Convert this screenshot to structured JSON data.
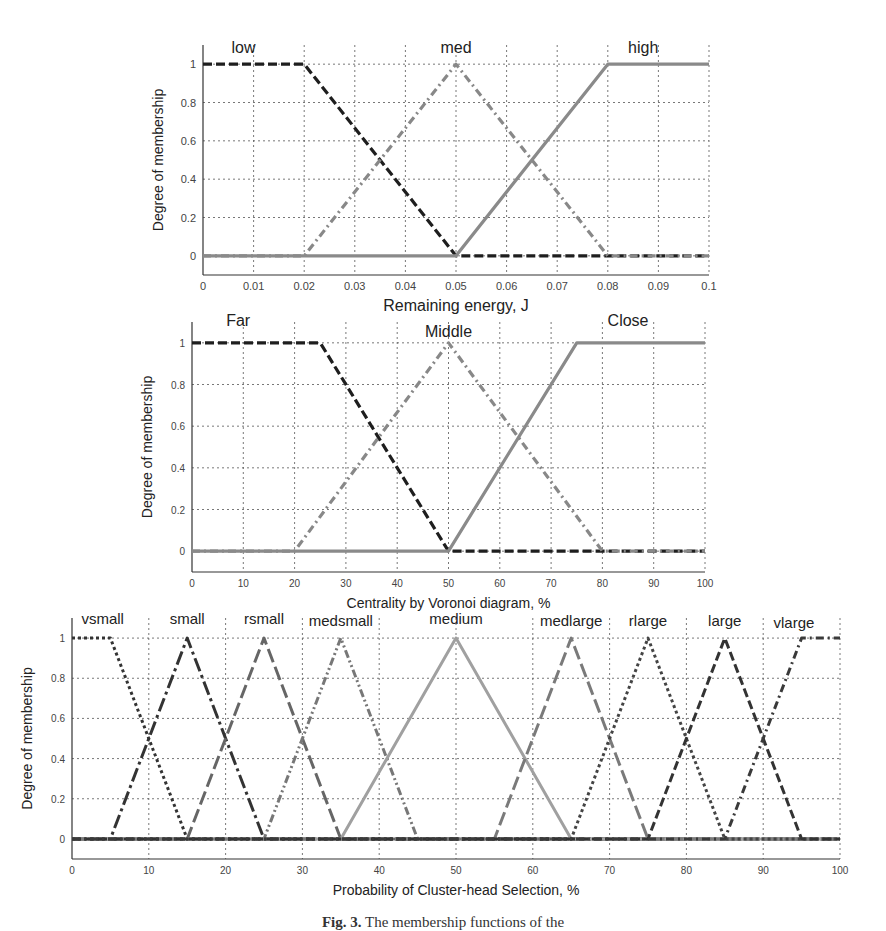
{
  "figure": {
    "caption_label": "Fig. 3.",
    "caption_text": "The membership functions of the"
  },
  "chart_data": [
    {
      "type": "line",
      "title": "",
      "xlabel": "Remaining energy, J",
      "ylabel": "Degree of membership",
      "xlim": [
        0,
        0.1
      ],
      "ylim": [
        -0.1,
        1.1
      ],
      "grid": true,
      "xticks": [
        0,
        0.01,
        0.02,
        0.03,
        0.04,
        0.05,
        0.06,
        0.07,
        0.08,
        0.09,
        0.1
      ],
      "xtick_labels": [
        "0",
        "0.01",
        "0.02",
        "0.03",
        "0.04",
        "0.05",
        "0.06",
        "0.07",
        "0.08",
        "0.09",
        "0.1"
      ],
      "yticks": [
        0,
        0.2,
        0.4,
        0.6,
        0.8,
        1
      ],
      "ytick_labels": [
        "0",
        "0.2",
        "0.4",
        "0.6",
        "0.8",
        "1"
      ],
      "box": {
        "left": 203,
        "right": 709,
        "top": 45,
        "bottom": 275
      },
      "series": [
        {
          "name": "low",
          "label_x": 0.008,
          "label_y": 1.06,
          "style": "dashed",
          "color": "#1e1e1e",
          "x": [
            0,
            0.02,
            0.05,
            0.1
          ],
          "y": [
            1,
            1,
            0,
            0
          ]
        },
        {
          "name": "med",
          "label_x": 0.05,
          "label_y": 1.06,
          "style": "dashdot",
          "color": "#888888",
          "x": [
            0,
            0.02,
            0.05,
            0.08,
            0.1
          ],
          "y": [
            0,
            0,
            1,
            0,
            0
          ]
        },
        {
          "name": "high",
          "label_x": 0.087,
          "label_y": 1.06,
          "style": "solid",
          "color": "#8a8a8a",
          "x": [
            0,
            0.05,
            0.08,
            0.1
          ],
          "y": [
            0,
            0,
            1,
            1
          ]
        }
      ]
    },
    {
      "type": "line",
      "title": "",
      "xlabel": "Centrality by Voronoi diagram, %",
      "ylabel": "Degree of membership",
      "xlim": [
        0,
        100
      ],
      "ylim": [
        -0.1,
        1.1
      ],
      "grid": true,
      "xticks": [
        0,
        10,
        20,
        30,
        40,
        50,
        60,
        70,
        80,
        90,
        100
      ],
      "xtick_labels": [
        "0",
        "10",
        "20",
        "30",
        "40",
        "50",
        "60",
        "70",
        "80",
        "90",
        "100"
      ],
      "yticks": [
        0,
        0.2,
        0.4,
        0.6,
        0.8,
        1
      ],
      "ytick_labels": [
        "0",
        "0.2",
        "0.4",
        "0.6",
        "0.8",
        "1"
      ],
      "box": {
        "left": 192,
        "right": 705,
        "top": 322,
        "bottom": 572
      },
      "series": [
        {
          "name": "Far",
          "label_x": 9,
          "label_y": 1.08,
          "style": "dashed",
          "color": "#1e1e1e",
          "x": [
            0,
            25,
            50,
            100
          ],
          "y": [
            1,
            1,
            0,
            0
          ]
        },
        {
          "name": "Middle",
          "label_x": 50,
          "label_y": 1.03,
          "style": "dashdot",
          "color": "#888888",
          "x": [
            0,
            20,
            50,
            80,
            100
          ],
          "y": [
            0,
            0,
            1,
            0,
            0
          ]
        },
        {
          "name": "Close",
          "label_x": 85,
          "label_y": 1.08,
          "style": "solid",
          "color": "#8a8a8a",
          "x": [
            0,
            50,
            75,
            100
          ],
          "y": [
            0,
            0,
            1,
            1
          ]
        }
      ]
    },
    {
      "type": "line",
      "title": "",
      "xlabel": "Probability of Cluster-head Selection, %",
      "ylabel": "Degree of membership",
      "xlim": [
        0,
        100
      ],
      "ylim": [
        -0.1,
        1.1
      ],
      "grid": true,
      "xticks": [
        0,
        10,
        20,
        30,
        40,
        50,
        60,
        70,
        80,
        90,
        100
      ],
      "xtick_labels": [
        "0",
        "10",
        "20",
        "30",
        "40",
        "50",
        "60",
        "70",
        "80",
        "90",
        "100"
      ],
      "yticks": [
        0,
        0.2,
        0.4,
        0.6,
        0.8,
        1
      ],
      "ytick_labels": [
        "0",
        "0.2",
        "0.4",
        "0.6",
        "0.8",
        "1"
      ],
      "box": {
        "left": 72,
        "right": 840,
        "top": 618,
        "bottom": 859
      },
      "series": [
        {
          "name": "vsmall",
          "label_x": 4,
          "label_y": 1.07,
          "style": "dotted",
          "color": "#333333",
          "x": [
            0,
            5,
            15,
            100
          ],
          "y": [
            1,
            1,
            0,
            0
          ]
        },
        {
          "name": "small",
          "label_x": 15,
          "label_y": 1.07,
          "style": "longdashdot",
          "color": "#333333",
          "x": [
            0,
            5,
            15,
            25,
            100
          ],
          "y": [
            0,
            0,
            1,
            0,
            0
          ]
        },
        {
          "name": "rsmall",
          "label_x": 25,
          "label_y": 1.07,
          "style": "longdash",
          "color": "#666666",
          "x": [
            0,
            15,
            25,
            35,
            100
          ],
          "y": [
            0,
            0,
            1,
            0,
            0
          ]
        },
        {
          "name": "medsmall",
          "label_x": 35,
          "label_y": 1.06,
          "style": "dashdotdot",
          "color": "#777777",
          "x": [
            0,
            25,
            35,
            45,
            100
          ],
          "y": [
            0,
            0,
            1,
            0,
            0
          ]
        },
        {
          "name": "medium",
          "label_x": 50,
          "label_y": 1.07,
          "style": "solid",
          "color": "#a0a0a0",
          "x": [
            0,
            35,
            50,
            65,
            100
          ],
          "y": [
            0,
            0,
            1,
            0,
            0
          ]
        },
        {
          "name": "medlarge",
          "label_x": 65,
          "label_y": 1.06,
          "style": "longdash",
          "color": "#7a7a7a",
          "x": [
            0,
            55,
            65,
            75,
            100
          ],
          "y": [
            0,
            0,
            1,
            0,
            0
          ]
        },
        {
          "name": "rlarge",
          "label_x": 75,
          "label_y": 1.06,
          "style": "dotted",
          "color": "#444444",
          "x": [
            0,
            65,
            75,
            85,
            100
          ],
          "y": [
            0,
            0,
            1,
            0,
            0
          ]
        },
        {
          "name": "large",
          "label_x": 85,
          "label_y": 1.06,
          "style": "dashed",
          "color": "#333333",
          "x": [
            0,
            75,
            85,
            95,
            100
          ],
          "y": [
            0,
            0,
            1,
            0,
            0
          ]
        },
        {
          "name": "vlarge",
          "label_x": 94,
          "label_y": 1.05,
          "style": "dashdot",
          "color": "#3a3a3a",
          "x": [
            0,
            85,
            95,
            100
          ],
          "y": [
            0,
            0,
            1,
            1
          ]
        }
      ]
    }
  ]
}
